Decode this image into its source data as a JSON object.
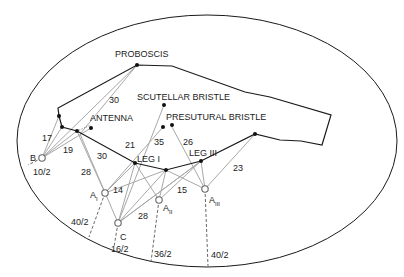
{
  "labels": {
    "proboscis": "PROBOSCIS",
    "scutellar_bristle": "SCUTELLAR BRISTLE",
    "antenna": "ANTENNA",
    "presutural_bristle": "PRESUTURAL BRISTLE",
    "leg_1": "LEG I",
    "leg_3": "LEG III",
    "anchor_b": "B",
    "anchor_a": "A",
    "anchor_a1_sub": "I",
    "anchor_a2_sub": "II",
    "anchor_a3_sub": "III",
    "anchor_c": "C"
  },
  "lengths": {
    "proboscis_line": "30",
    "b_17": "17",
    "b_19": "19",
    "a1_30": "30",
    "a1_28": "28",
    "leg_21": "21",
    "leg_35": "35",
    "leg_26": "26",
    "a1_14": "14",
    "c_28": "28",
    "a2_15": "15",
    "a3_23": "23"
  },
  "ratios": {
    "b": "10/2",
    "a1": "40/2",
    "c": "16/2",
    "a2": "36/2",
    "a3": "40/2"
  },
  "colors": {
    "outline": "#1a1a1a",
    "connector": "#a8a8a8",
    "dashed": "#555555"
  }
}
